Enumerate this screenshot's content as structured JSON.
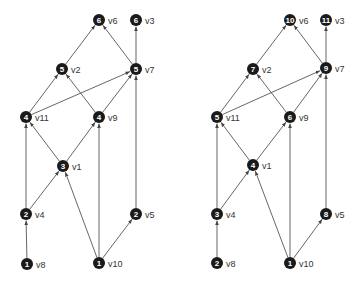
{
  "colors": {
    "node": "#1a1a1a",
    "edge": "#555555",
    "label": "#333333",
    "background": "#ffffff"
  },
  "graphs": [
    {
      "name": "left-graph",
      "nodes": [
        {
          "id": "v6",
          "label": "v6",
          "value": "6",
          "x": 99,
          "y": 20
        },
        {
          "id": "v3",
          "label": "v3",
          "value": "6",
          "x": 136,
          "y": 20
        },
        {
          "id": "v2",
          "label": "v2",
          "value": "5",
          "x": 62,
          "y": 69
        },
        {
          "id": "v7",
          "label": "v7",
          "value": "5",
          "x": 136,
          "y": 69
        },
        {
          "id": "v11",
          "label": "v11",
          "value": "4",
          "x": 26,
          "y": 117
        },
        {
          "id": "v9",
          "label": "v9",
          "value": "4",
          "x": 99,
          "y": 117
        },
        {
          "id": "v1",
          "label": "v1",
          "value": "3",
          "x": 63,
          "y": 166
        },
        {
          "id": "v4",
          "label": "v4",
          "value": "2",
          "x": 26,
          "y": 214
        },
        {
          "id": "v5",
          "label": "v5",
          "value": "2",
          "x": 136,
          "y": 214
        },
        {
          "id": "v8",
          "label": "v8",
          "value": "1",
          "x": 27,
          "y": 264
        },
        {
          "id": "v10",
          "label": "v10",
          "value": "1",
          "x": 99,
          "y": 263
        }
      ]
    },
    {
      "name": "right-graph",
      "nodes": [
        {
          "id": "v6",
          "label": "v6",
          "value": "10",
          "x": 290,
          "y": 20
        },
        {
          "id": "v3",
          "label": "v3",
          "value": "11",
          "x": 326,
          "y": 20
        },
        {
          "id": "v2",
          "label": "v2",
          "value": "7",
          "x": 253,
          "y": 69
        },
        {
          "id": "v7",
          "label": "v7",
          "value": "9",
          "x": 326,
          "y": 68
        },
        {
          "id": "v11",
          "label": "v11",
          "value": "5",
          "x": 217,
          "y": 117
        },
        {
          "id": "v9",
          "label": "v9",
          "value": "6",
          "x": 290,
          "y": 117
        },
        {
          "id": "v1",
          "label": "v1",
          "value": "4",
          "x": 253,
          "y": 165
        },
        {
          "id": "v4",
          "label": "v4",
          "value": "3",
          "x": 217,
          "y": 214
        },
        {
          "id": "v5",
          "label": "v5",
          "value": "8",
          "x": 326,
          "y": 214
        },
        {
          "id": "v8",
          "label": "v8",
          "value": "2",
          "x": 217,
          "y": 263
        },
        {
          "id": "v10",
          "label": "v10",
          "value": "1",
          "x": 290,
          "y": 263
        }
      ]
    }
  ],
  "edges": [
    [
      "v8",
      "v4"
    ],
    [
      "v4",
      "v1"
    ],
    [
      "v4",
      "v11"
    ],
    [
      "v10",
      "v1"
    ],
    [
      "v10",
      "v9"
    ],
    [
      "v10",
      "v5"
    ],
    [
      "v1",
      "v11"
    ],
    [
      "v1",
      "v9"
    ],
    [
      "v11",
      "v2"
    ],
    [
      "v11",
      "v7"
    ],
    [
      "v9",
      "v2"
    ],
    [
      "v9",
      "v7"
    ],
    [
      "v2",
      "v6"
    ],
    [
      "v7",
      "v6"
    ],
    [
      "v7",
      "v3"
    ],
    [
      "v5",
      "v7"
    ]
  ]
}
